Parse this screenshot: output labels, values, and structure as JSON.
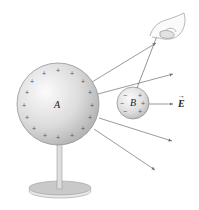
{
  "figure": {
    "labels": {
      "sphere_a": "A",
      "sphere_b": "B",
      "field": "E"
    },
    "sphere_a": {
      "charge_sign": "+",
      "charges_count": 16
    },
    "sphere_b": {
      "left_charges": [
        "−",
        "−",
        "−"
      ],
      "right_charges": [
        "+",
        "+",
        "+"
      ]
    },
    "field_arrow_symbol": "→",
    "colors": {
      "sphere_light": "#f4f4f4",
      "sphere_dark": "#b9b9b9",
      "line": "#6e6e6e",
      "stand": "#c8c8c8"
    }
  }
}
